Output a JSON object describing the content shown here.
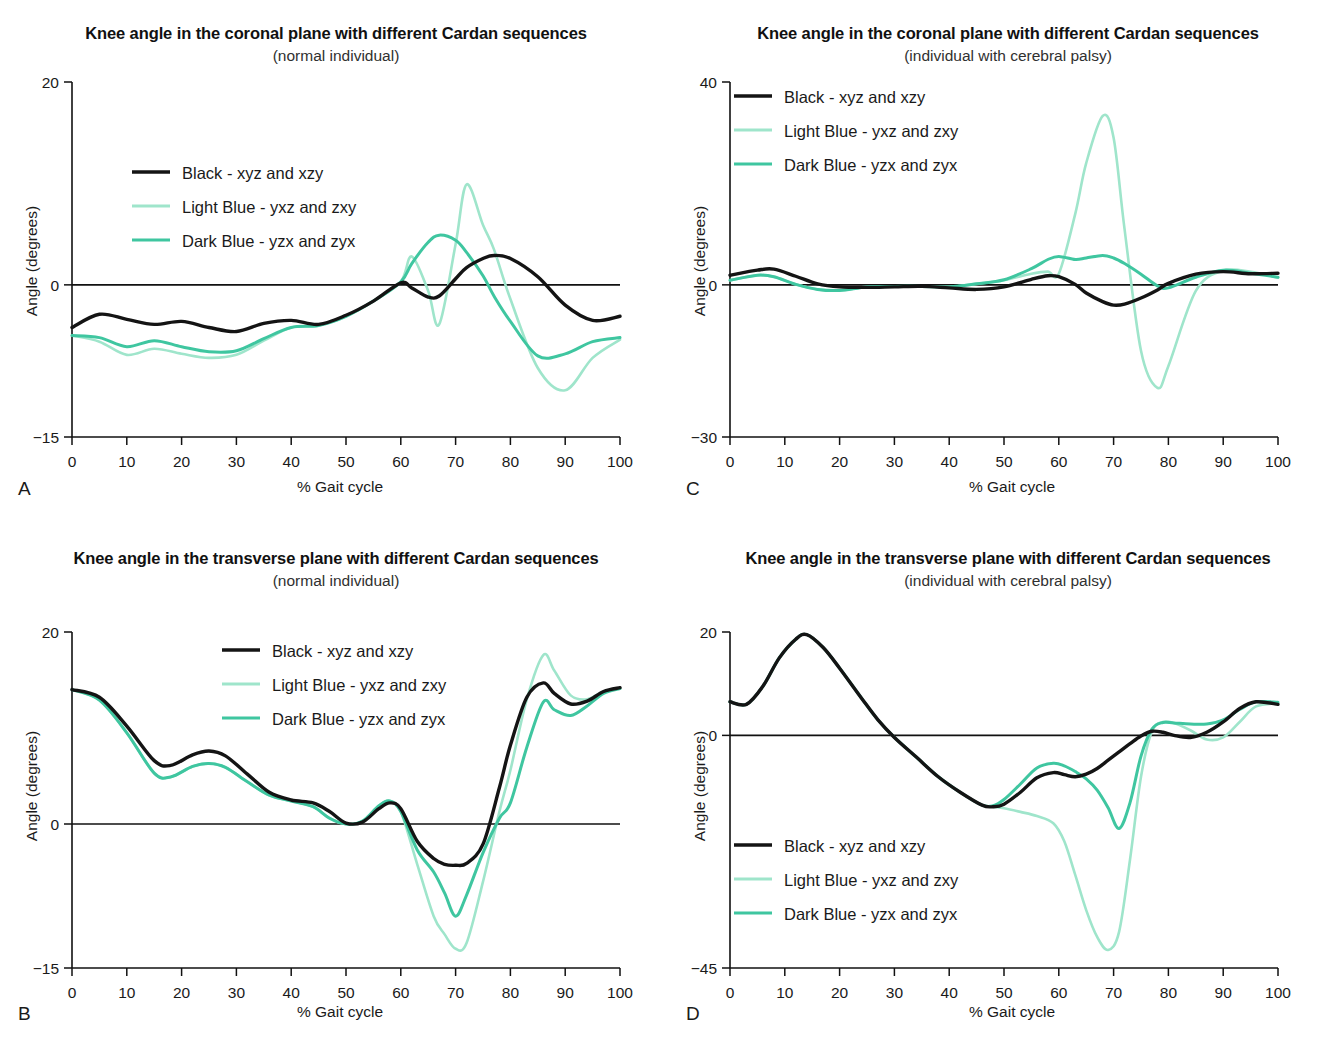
{
  "figure": {
    "colors": {
      "black": "#141414",
      "light_blue": "#9fe5cb",
      "dark_blue": "#3fc6a0",
      "axis": "#111111",
      "background": "#ffffff"
    },
    "legend_entries": [
      {
        "key": "black",
        "label": "Black - xyz and xzy"
      },
      {
        "key": "light_blue",
        "label": "Light Blue - yxz and zxy"
      },
      {
        "key": "dark_blue",
        "label": "Dark Blue - yzx and zyx"
      }
    ],
    "panels": [
      {
        "letter": "A",
        "title": "Knee angle in the coronal plane with different Cardan sequences",
        "subtitle": "(normal individual)",
        "ylabel": "Angle (degrees)",
        "xlabel": "% Gait cycle"
      },
      {
        "letter": "C",
        "title": "Knee angle in the coronal plane with different Cardan sequences",
        "subtitle": "(individual with cerebral palsy)",
        "ylabel": "Angle (degrees)",
        "xlabel": "% Gait cycle"
      },
      {
        "letter": "B",
        "title": "Knee angle in the transverse plane with different Cardan sequences",
        "subtitle": "(normal individual)",
        "ylabel": "Angle (degrees)",
        "xlabel": "% Gait cycle"
      },
      {
        "letter": "D",
        "title": "Knee angle in the transverse plane with different Cardan sequences",
        "subtitle": "(individual with cerebral palsy)",
        "ylabel": "Angle (degrees)",
        "xlabel": "% Gait cycle"
      }
    ]
  },
  "chart_data": [
    {
      "id": "A",
      "type": "line",
      "title": "Knee angle in the coronal plane with different Cardan sequences",
      "subtitle": "(normal individual)",
      "xlabel": "% Gait cycle",
      "ylabel": "Angle (degrees)",
      "xlim": [
        0,
        100
      ],
      "ylim": [
        -15,
        20
      ],
      "xticks": [
        0,
        10,
        20,
        30,
        40,
        50,
        60,
        70,
        80,
        90,
        100
      ],
      "yticks": [
        -15,
        0,
        20
      ],
      "ytick_labels": [
        "−15",
        "0",
        "20"
      ],
      "grid": false,
      "legend_position": "upper-left-inside",
      "x": [
        0,
        5,
        10,
        15,
        20,
        25,
        30,
        35,
        40,
        45,
        50,
        55,
        60,
        62,
        65,
        67,
        70,
        72,
        75,
        77,
        80,
        85,
        90,
        95,
        100
      ],
      "series": [
        {
          "name": "Black - xyz and xzy",
          "color": "#141414",
          "values": [
            -4.2,
            -2.9,
            -3.4,
            -3.9,
            -3.6,
            -4.2,
            -4.6,
            -3.8,
            -3.5,
            -3.9,
            -3.0,
            -1.6,
            0.2,
            -0.3,
            -1.2,
            -1.1,
            0.6,
            1.7,
            2.6,
            2.9,
            2.6,
            0.8,
            -2.0,
            -3.5,
            -3.1
          ]
        },
        {
          "name": "Light Blue - yxz and zxy",
          "color": "#9fe5cb",
          "values": [
            -5.0,
            -5.6,
            -6.9,
            -6.3,
            -6.8,
            -7.2,
            -6.9,
            -5.5,
            -4.2,
            -4.0,
            -3.1,
            -1.6,
            0.3,
            2.8,
            -0.6,
            -3.9,
            4.0,
            9.9,
            5.9,
            3.5,
            -1.4,
            -8.2,
            -10.4,
            -7.2,
            -5.4
          ]
        },
        {
          "name": "Dark Blue - yzx and zyx",
          "color": "#3fc6a0",
          "values": [
            -5.0,
            -5.2,
            -6.1,
            -5.5,
            -6.1,
            -6.6,
            -6.5,
            -5.3,
            -4.2,
            -4.0,
            -3.1,
            -1.6,
            0.3,
            2.1,
            4.2,
            4.9,
            4.4,
            3.2,
            0.9,
            -1.1,
            -3.6,
            -7.0,
            -6.8,
            -5.6,
            -5.2
          ]
        }
      ]
    },
    {
      "id": "C",
      "type": "line",
      "title": "Knee angle in the coronal plane with different Cardan sequences",
      "subtitle": "(individual with cerebral palsy)",
      "xlabel": "% Gait cycle",
      "ylabel": "Angle (degrees)",
      "xlim": [
        0,
        100
      ],
      "ylim": [
        -30,
        40
      ],
      "xticks": [
        0,
        10,
        20,
        30,
        40,
        50,
        60,
        70,
        80,
        90,
        100
      ],
      "yticks": [
        -30,
        0,
        40
      ],
      "ytick_labels": [
        "−30",
        "0",
        "40"
      ],
      "grid": false,
      "legend_position": "upper-left-inside",
      "x": [
        0,
        5,
        8,
        12,
        16,
        20,
        25,
        30,
        35,
        40,
        45,
        50,
        55,
        58,
        60,
        63,
        65,
        68,
        70,
        72,
        75,
        78,
        80,
        85,
        90,
        95,
        100
      ],
      "series": [
        {
          "name": "Black - xyz and xzy",
          "color": "#141414",
          "values": [
            1.9,
            2.9,
            3.1,
            1.7,
            0.2,
            -0.4,
            -0.5,
            -0.4,
            -0.3,
            -0.6,
            -0.9,
            -0.4,
            1.1,
            1.8,
            1.6,
            0.1,
            -1.6,
            -3.3,
            -4.0,
            -3.8,
            -2.6,
            -1.0,
            0.3,
            2.1,
            2.6,
            2.2,
            2.3
          ]
        },
        {
          "name": "Light Blue - yxz and zxy",
          "color": "#9fe5cb",
          "values": [
            0.9,
            1.9,
            1.6,
            0.1,
            -0.9,
            -1.1,
            -0.4,
            -0.3,
            -0.3,
            -0.4,
            0.2,
            0.9,
            2.2,
            2.6,
            2.2,
            14.0,
            24.0,
            33.3,
            29.0,
            11.0,
            -13.0,
            -20.3,
            -16.0,
            -1.2,
            2.8,
            2.6,
            1.4
          ]
        },
        {
          "name": "Dark Blue - yzx and zyx",
          "color": "#3fc6a0",
          "values": [
            0.9,
            1.9,
            1.6,
            0.1,
            -0.9,
            -1.1,
            -0.4,
            -0.3,
            -0.3,
            -0.4,
            0.2,
            1.0,
            3.2,
            5.0,
            5.6,
            5.0,
            5.3,
            5.8,
            5.3,
            4.2,
            2.1,
            -0.2,
            -0.6,
            1.5,
            2.9,
            2.3,
            1.5
          ]
        }
      ]
    },
    {
      "id": "B",
      "type": "line",
      "title": "Knee angle in the transverse plane with different Cardan sequences",
      "subtitle": "(normal individual)",
      "xlabel": "% Gait cycle",
      "ylabel": "Angle (degrees)",
      "xlim": [
        0,
        100
      ],
      "ylim": [
        -15,
        20
      ],
      "xticks": [
        0,
        10,
        20,
        30,
        40,
        50,
        60,
        70,
        80,
        90,
        100
      ],
      "yticks": [
        -15,
        0,
        20
      ],
      "ytick_labels": [
        "−15",
        "0",
        "20"
      ],
      "grid": false,
      "legend_position": "upper-center-inside",
      "x": [
        0,
        5,
        10,
        15,
        18,
        22,
        25,
        28,
        32,
        36,
        40,
        44,
        47,
        50,
        53,
        56,
        58,
        60,
        63,
        66,
        68,
        70,
        72,
        75,
        78,
        80,
        83,
        86,
        88,
        91,
        94,
        97,
        100
      ],
      "series": [
        {
          "name": "Black - xyz and xzy",
          "color": "#141414",
          "values": [
            14.0,
            13.2,
            10.2,
            6.6,
            6.1,
            7.2,
            7.6,
            7.1,
            5.2,
            3.3,
            2.5,
            2.2,
            1.3,
            0.1,
            0.2,
            1.6,
            2.2,
            1.6,
            -1.8,
            -3.6,
            -4.2,
            -4.3,
            -4.1,
            -2.1,
            3.8,
            8.2,
            13.2,
            14.7,
            13.6,
            12.5,
            12.8,
            13.8,
            14.2
          ]
        },
        {
          "name": "Light Blue - yxz and zxy",
          "color": "#9fe5cb",
          "values": [
            14.0,
            12.9,
            9.5,
            5.3,
            4.9,
            6.0,
            6.3,
            5.9,
            4.4,
            3.0,
            2.4,
            1.8,
            0.6,
            0.0,
            0.3,
            1.9,
            2.4,
            1.3,
            -4.2,
            -9.6,
            -11.5,
            -13.0,
            -12.4,
            -6.0,
            1.3,
            5.6,
            13.0,
            17.6,
            16.0,
            13.4,
            13.0,
            13.8,
            14.1
          ]
        },
        {
          "name": "Dark Blue - yzx and zyx",
          "color": "#3fc6a0",
          "values": [
            14.0,
            12.9,
            9.5,
            5.3,
            4.9,
            6.0,
            6.3,
            5.9,
            4.4,
            3.0,
            2.4,
            1.8,
            0.6,
            0.0,
            0.3,
            1.9,
            2.4,
            1.3,
            -2.7,
            -5.0,
            -7.2,
            -9.6,
            -7.4,
            -3.0,
            0.6,
            2.2,
            8.0,
            12.7,
            11.9,
            11.3,
            12.3,
            13.6,
            14.1
          ]
        }
      ]
    },
    {
      "id": "D",
      "type": "line",
      "title": "Knee angle in the transverse plane with different Cardan sequences",
      "subtitle": "(individual with cerebral palsy)",
      "xlabel": "% Gait cycle",
      "ylabel": "Angle (degrees)",
      "xlim": [
        0,
        100
      ],
      "ylim": [
        -45,
        20
      ],
      "xticks": [
        0,
        10,
        20,
        30,
        40,
        50,
        60,
        70,
        80,
        90,
        100
      ],
      "yticks": [
        -45,
        0,
        20
      ],
      "ytick_labels": [
        "−45",
        "0",
        "20"
      ],
      "grid": false,
      "legend_position": "lower-left-inside",
      "x": [
        0,
        3,
        6,
        9,
        12,
        14,
        17,
        20,
        24,
        27,
        30,
        34,
        38,
        42,
        46,
        48,
        50,
        53,
        56,
        59,
        61,
        63,
        65,
        67,
        69,
        71,
        73,
        75,
        77,
        79,
        81,
        84,
        87,
        90,
        93,
        96,
        100
      ],
      "series": [
        {
          "name": "Black - xyz and xzy",
          "color": "#141414",
          "values": [
            6.5,
            6.0,
            9.5,
            15.0,
            18.6,
            19.5,
            17.0,
            13.0,
            7.2,
            3.0,
            -0.4,
            -4.2,
            -8.0,
            -11.0,
            -13.5,
            -13.8,
            -13.3,
            -11.0,
            -8.2,
            -7.2,
            -7.6,
            -8.0,
            -7.5,
            -6.4,
            -4.8,
            -3.2,
            -1.6,
            -0.1,
            0.8,
            0.6,
            0.0,
            -0.4,
            0.6,
            2.6,
            5.2,
            6.5,
            6.0
          ]
        },
        {
          "name": "Light Blue - yxz and zxy",
          "color": "#9fe5cb",
          "values": [
            6.5,
            6.0,
            9.5,
            15.0,
            18.6,
            19.5,
            17.0,
            13.0,
            7.2,
            3.0,
            -0.4,
            -4.2,
            -8.0,
            -11.0,
            -13.5,
            -13.8,
            -14.1,
            -14.8,
            -15.6,
            -17.0,
            -20.5,
            -27.0,
            -33.8,
            -39.0,
            -41.5,
            -38.0,
            -24.0,
            -8.0,
            0.8,
            2.6,
            2.4,
            1.0,
            -0.8,
            -0.4,
            2.6,
            5.6,
            6.2
          ]
        },
        {
          "name": "Dark Blue - yzx and zyx",
          "color": "#3fc6a0",
          "values": [
            6.5,
            6.0,
            9.5,
            15.0,
            18.6,
            19.5,
            17.0,
            13.0,
            7.2,
            3.0,
            -0.4,
            -4.2,
            -8.0,
            -11.0,
            -13.5,
            -13.6,
            -12.4,
            -9.4,
            -6.3,
            -5.4,
            -5.9,
            -7.0,
            -8.4,
            -10.6,
            -14.0,
            -18.0,
            -13.0,
            -4.0,
            1.2,
            2.5,
            2.4,
            2.2,
            2.2,
            3.0,
            5.0,
            6.5,
            6.4
          ]
        }
      ]
    }
  ]
}
